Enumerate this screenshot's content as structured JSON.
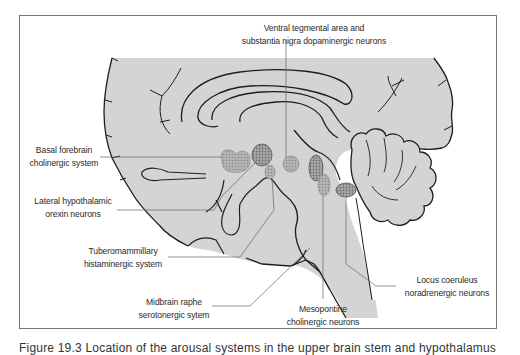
{
  "figure": {
    "colors": {
      "brain_fill": "#d4d4d4",
      "outline": "#1e1e1e",
      "leader_line": "#666666",
      "nucleus_fill": "#b8b8b8",
      "nucleus_dots": "#8a8a8a",
      "frame_border": "#777777",
      "text": "#2a2a2a"
    },
    "labels": {
      "vta": {
        "line1": "Ventral tegmental area and",
        "line2": "substantia nigra dopaminergic neurons"
      },
      "basal_forebrain": {
        "line1": "Basal forebrain",
        "line2": "cholinergic system"
      },
      "lateral_hypothalamic": {
        "line1": "Lateral hypothalamic",
        "line2": "orexin neurons"
      },
      "tuberomammillary": {
        "line1": "Tuberomammillary",
        "line2": "histaminergic system"
      },
      "midbrain_raphe": {
        "line1": "Midbrain raphe",
        "line2": "serotonergic sytem"
      },
      "mesopontine": {
        "line1": "Mesopontine",
        "line2": "cholinergic neurons"
      },
      "locus_coeruleus": {
        "line1": "Locus coeruleus",
        "line2": "noradrenergic neurons"
      }
    },
    "caption": "Figure 19.3 Location of the arousal systems in the upper brain stem and hypothalamus"
  }
}
